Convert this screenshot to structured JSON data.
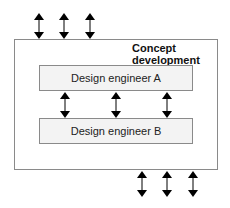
{
  "diagram": {
    "container": {
      "label_line1": "Concept",
      "label_line2": "development"
    },
    "boxes": [
      {
        "id": "A",
        "label": "Design engineer A"
      },
      {
        "id": "B",
        "label": "Design engineer B"
      }
    ],
    "arrows": {
      "top_external": 3,
      "between_engineers": 3,
      "bottom_external": 3,
      "type": "bidirectional"
    },
    "colors": {
      "border": "#8a8a8a",
      "box_fill": "#f3f3f3",
      "arrow": "#000000"
    }
  }
}
